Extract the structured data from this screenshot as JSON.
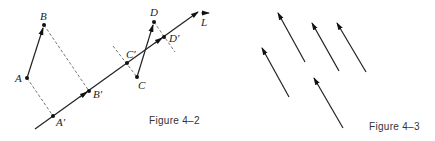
{
  "figures": [
    {
      "id": "fig-4-2",
      "caption": "Figure 4–2",
      "line": {
        "label": "L",
        "from": [
          35,
          129
        ],
        "to": [
          198,
          12
        ]
      },
      "points": [
        {
          "name": "A",
          "label": "A",
          "xy": [
            27,
            78
          ]
        },
        {
          "name": "B",
          "label": "B",
          "xy": [
            44,
            25
          ]
        },
        {
          "name": "A-prime",
          "label": "A′",
          "xy": [
            53,
            116
          ]
        },
        {
          "name": "B-prime",
          "label": "B′",
          "xy": [
            89,
            91
          ]
        },
        {
          "name": "C",
          "label": "C",
          "xy": [
            137,
            77
          ]
        },
        {
          "name": "D",
          "label": "D",
          "xy": [
            154,
            22
          ]
        },
        {
          "name": "C-prime",
          "label": "C′",
          "xy": [
            127,
            63
          ]
        },
        {
          "name": "D-prime",
          "label": "D′",
          "xy": [
            164,
            37
          ]
        }
      ],
      "vectors": [
        {
          "name": "vector-AB",
          "from": "A",
          "to": "B"
        },
        {
          "name": "vector-CD",
          "from": "C",
          "to": "D"
        },
        {
          "name": "vector-AprimeBprime",
          "from": "A′",
          "to": "B′"
        },
        {
          "name": "vector-CprimeDprime",
          "from": "C′",
          "to": "D′"
        }
      ],
      "projections": [
        {
          "name": "projection-A",
          "from": "A",
          "to": "A′"
        },
        {
          "name": "projection-B",
          "from": "B",
          "to": "B′"
        },
        {
          "name": "projection-C",
          "from": "C",
          "to": "C′"
        },
        {
          "name": "projection-D",
          "from": "D",
          "to": "D′"
        }
      ]
    },
    {
      "id": "fig-4-3",
      "caption": "Figure 4–3",
      "arrows": [
        {
          "tail": [
            289,
            97
          ],
          "tip": [
            262,
            48
          ]
        },
        {
          "tail": [
            305,
            62
          ],
          "tip": [
            278,
            13
          ]
        },
        {
          "tail": [
            339,
            71
          ],
          "tip": [
            312,
            23
          ]
        },
        {
          "tail": [
            366,
            72
          ],
          "tip": [
            337,
            23
          ]
        },
        {
          "tail": [
            343,
            128
          ],
          "tip": [
            314,
            78
          ]
        }
      ]
    }
  ],
  "labels": {
    "A": "A",
    "B": "B",
    "A_prime": "A′",
    "B_prime": "B′",
    "C": "C",
    "D": "D",
    "C_prime": "C′",
    "D_prime": "D′",
    "L": "L",
    "caption_4_2": "Figure 4–2",
    "caption_4_3": "Figure 4–3"
  }
}
